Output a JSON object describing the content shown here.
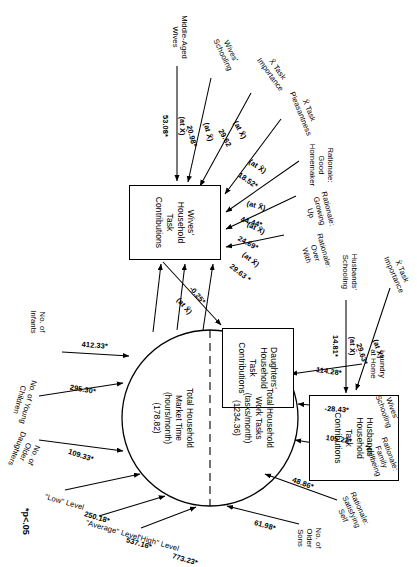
{
  "figure": {
    "footnote": "*p<.05",
    "nodes": {
      "wives_box": "Wives'\nHousehold\nTask\nContributions",
      "husbands_box": "Husbands'\nHousehold\nTask\nContributions",
      "daughters_box": "Daughters'\nHousehold\nTask\nContributions",
      "tasks_circle": "Total Household\nWork Tasks\n(tasks/month)\n(1234.36)",
      "market_circle": "Total Household\nMarket Time\n(hours/month)\n(178.82)"
    },
    "wives_predictors": [
      {
        "label": "Middle-Aged\nWives",
        "coef": "53.08*",
        "note": "(at X̄)"
      },
      {
        "label": "Wives'\nSchooling",
        "coef": "20.98*",
        "note": "(at X̄)"
      },
      {
        "label": "X̄ Task\nImportance",
        "coef": "29.62",
        "note": "(at X̄)"
      },
      {
        "label": "X̄ Task\nPleasantness",
        "coef": "18.52*",
        "note": "(at X̄)"
      },
      {
        "label": "Rationale:\nGood\nHomemaker",
        "coef": "44.44*",
        "note": "(at X̄)"
      },
      {
        "label": "Rationale:\nGrowing\nUp",
        "coef": "24.69*",
        "note": "(at X̄)"
      },
      {
        "label": "Rationale:\nOver\nWith",
        "coef": "29.63 *",
        "note": "(at X̄)"
      }
    ],
    "husbands_predictors": [
      {
        "label": "X̄ Task\nImportance",
        "coef": "29.63*",
        "note": "(at X̄)"
      },
      {
        "label": "Husbands'\nSchooling",
        "coef": "14.81*",
        "note": "(at X̄)"
      }
    ],
    "daughters_link": {
      "coef": "-0.25*",
      "note": "(at X̄)"
    },
    "circle_predictors": [
      {
        "label": "No. of\nInfants",
        "coef": "412.33*"
      },
      {
        "label": "No. of Young\nChildren",
        "coef": "295.30*"
      },
      {
        "label": "No. of\nOlder\nDaughters",
        "coef": "109.33*"
      },
      {
        "label": "\"Low\" Level",
        "coef": "250.18*"
      },
      {
        "label": "\"Average\" Level",
        "coef": "537.16*"
      },
      {
        "label": "\"High\" Level",
        "coef": "773.23*"
      },
      {
        "label": "No. of\nOlder\nSons",
        "coef": "61.98*"
      },
      {
        "label": "Rationale:\nSatisfying\nSelf",
        "coef": "48.86*"
      },
      {
        "label": "Rationale:\nFamily\nWellbeing",
        "coef": "105.22*"
      },
      {
        "label": "Wives'\nSchooling",
        "coef": "-28.43*"
      },
      {
        "label": "Laundry\nat Home",
        "coef": "114.28*"
      }
    ]
  }
}
